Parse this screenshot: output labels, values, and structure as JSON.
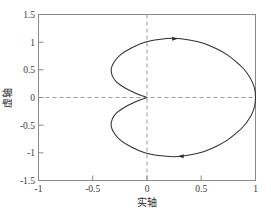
{
  "chart_data": {
    "type": "line",
    "title": "",
    "subtitle": "",
    "xlabel": "实轴",
    "ylabel": "虚轴",
    "xlim": [
      -1,
      1
    ],
    "ylim": [
      -1.5,
      1.5
    ],
    "xticks": [
      -1,
      -0.5,
      0,
      0.5,
      1
    ],
    "xtick_labels": [
      "-1",
      "-0.5",
      "0",
      "0.5",
      "1"
    ],
    "yticks": [
      -1.5,
      -1,
      -0.5,
      0,
      0.5,
      1,
      1.5
    ],
    "ytick_labels": [
      "-1.5",
      "-1",
      "-0.5",
      "0",
      "0.5",
      "1",
      "1.5"
    ],
    "grid": false,
    "legend": null,
    "legend_position": "none",
    "reference_lines": [
      {
        "axis": "x",
        "value": 0,
        "style": "dashed",
        "color": "#9b9b9b"
      },
      {
        "axis": "y",
        "value": 0,
        "style": "dashed",
        "color": "#9b9b9b"
      }
    ],
    "curve_color": "#2e2e2e",
    "series": [
      {
        "name": "Nyquist contour",
        "closed": true,
        "cusp_at": [
          0,
          0
        ],
        "rightmost_point": [
          1,
          0
        ],
        "leftmost_loop_point": [
          -0.33,
          0
        ],
        "max_y": 1.07,
        "min_y": -1.07,
        "points": [
          [
            1.0,
            0.0
          ],
          [
            0.995,
            0.13
          ],
          [
            0.975,
            0.26
          ],
          [
            0.94,
            0.39
          ],
          [
            0.89,
            0.52
          ],
          [
            0.82,
            0.65
          ],
          [
            0.74,
            0.77
          ],
          [
            0.64,
            0.88
          ],
          [
            0.52,
            0.98
          ],
          [
            0.39,
            1.04
          ],
          [
            0.25,
            1.07
          ],
          [
            0.11,
            1.05
          ],
          [
            -0.02,
            1.0
          ],
          [
            -0.14,
            0.9
          ],
          [
            -0.24,
            0.78
          ],
          [
            -0.3,
            0.65
          ],
          [
            -0.33,
            0.52
          ],
          [
            -0.32,
            0.39
          ],
          [
            -0.28,
            0.28
          ],
          [
            -0.21,
            0.18
          ],
          [
            -0.13,
            0.1
          ],
          [
            -0.06,
            0.04
          ],
          [
            0.0,
            0.0
          ],
          [
            -0.06,
            -0.04
          ],
          [
            -0.13,
            -0.1
          ],
          [
            -0.21,
            -0.18
          ],
          [
            -0.28,
            -0.28
          ],
          [
            -0.32,
            -0.39
          ],
          [
            -0.33,
            -0.52
          ],
          [
            -0.3,
            -0.65
          ],
          [
            -0.24,
            -0.78
          ],
          [
            -0.14,
            -0.9
          ],
          [
            -0.02,
            -1.0
          ],
          [
            0.11,
            -1.05
          ],
          [
            0.25,
            -1.07
          ],
          [
            0.39,
            -1.04
          ],
          [
            0.52,
            -0.98
          ],
          [
            0.64,
            -0.88
          ],
          [
            0.74,
            -0.77
          ],
          [
            0.82,
            -0.65
          ],
          [
            0.89,
            -0.52
          ],
          [
            0.94,
            -0.39
          ],
          [
            0.975,
            -0.26
          ],
          [
            0.995,
            -0.13
          ],
          [
            1.0,
            0.0
          ]
        ]
      }
    ],
    "annotations": [
      {
        "type": "arrow-head",
        "at": [
          0.25,
          1.06
        ],
        "direction": "right",
        "label": ""
      },
      {
        "type": "arrow-head",
        "at": [
          0.32,
          -1.06
        ],
        "direction": "left",
        "label": ""
      }
    ]
  }
}
